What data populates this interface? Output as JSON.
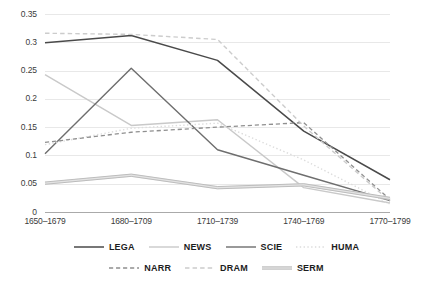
{
  "chart_data": {
    "type": "line",
    "title": "",
    "subtitle": "",
    "xlabel": "",
    "ylabel": "",
    "categories": [
      "1650–1679",
      "1680–1709",
      "1710–1739",
      "1740–1769",
      "1770–1799"
    ],
    "yticks": [
      "0",
      "0.05",
      "0.1",
      "0.15",
      "0.2",
      "0.25",
      "0.3",
      "0.35"
    ],
    "ytick_values": [
      0,
      0.05,
      0.1,
      0.15,
      0.2,
      0.25,
      0.3,
      0.35
    ],
    "ylim": [
      0,
      0.35
    ],
    "grid": "horizontal",
    "legend_position": "bottom",
    "series": [
      {
        "name": "LEGA",
        "values": [
          0.299,
          0.312,
          0.268,
          0.143,
          0.057
        ],
        "color": "#4a4a4a",
        "style": "solid",
        "width": 1.5
      },
      {
        "name": "NEWS",
        "values": [
          0.243,
          0.153,
          0.163,
          0.043,
          0.016
        ],
        "color": "#c9c9c9",
        "style": "solid",
        "width": 1.4
      },
      {
        "name": "SCIE",
        "values": [
          0.103,
          0.254,
          0.11,
          0.065,
          0.02
        ],
        "color": "#6e6e6e",
        "style": "solid",
        "width": 1.4
      },
      {
        "name": "HUMA",
        "values": [
          0.119,
          0.148,
          0.157,
          0.092,
          0.014
        ],
        "color": "#dcdcdc",
        "style": "dotted",
        "width": 1.4
      },
      {
        "name": "NARR",
        "values": [
          0.123,
          0.141,
          0.15,
          0.158,
          0.022
        ],
        "color": "#8f8f8f",
        "style": "dashed",
        "width": 1.3
      },
      {
        "name": "DRAM",
        "values": [
          0.316,
          0.314,
          0.305,
          0.152,
          0.019
        ],
        "color": "#cccccc",
        "style": "dashed",
        "width": 1.4
      },
      {
        "name": "SERM",
        "values": [
          0.051,
          0.065,
          0.043,
          0.048,
          0.024
        ],
        "color": "#b3b3b3",
        "style": "thick-double",
        "width": 3.0
      }
    ]
  },
  "legend": {
    "row1": [
      {
        "label": "LEGA",
        "swatch": "line-solid-dark"
      },
      {
        "label": "NEWS",
        "swatch": "line-solid-light"
      },
      {
        "label": "SCIE",
        "swatch": "line-solid-medium"
      },
      {
        "label": "HUMA",
        "swatch": "line-dotted-light"
      }
    ],
    "row2": [
      {
        "label": "NARR",
        "swatch": "line-dashed-medium"
      },
      {
        "label": "DRAM",
        "swatch": "line-dashed-light"
      },
      {
        "label": "SERM",
        "swatch": "line-thick-gray"
      }
    ]
  },
  "colors": {
    "background": "#ffffff",
    "grid": "#e8e8e8",
    "axis": "#aaaaaa",
    "tick_text": "#3b3b3b",
    "legend_text": "#1d1d1d"
  }
}
